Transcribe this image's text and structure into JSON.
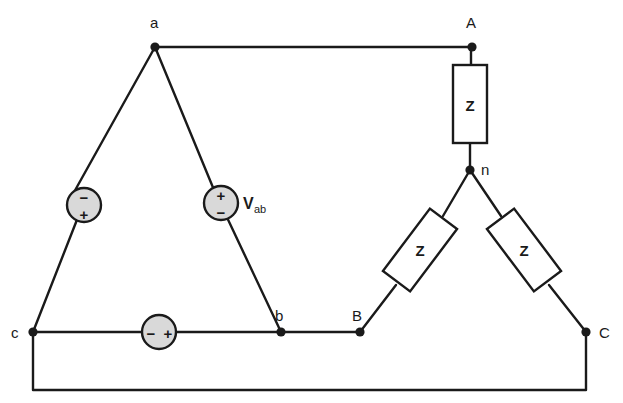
{
  "diagram": {
    "type": "circuit-schematic",
    "nodes": [
      {
        "id": "a",
        "label": "a",
        "x": 155,
        "y": 47,
        "label_x": 150,
        "label_y": 28
      },
      {
        "id": "b",
        "label": "b",
        "x": 281,
        "y": 332,
        "label_x": 275,
        "label_y": 320
      },
      {
        "id": "c",
        "label": "c",
        "x": 33,
        "y": 332,
        "label_x": 12,
        "label_y": 338
      },
      {
        "id": "A",
        "label": "A",
        "x": 472,
        "y": 47,
        "label_x": 466,
        "label_y": 28
      },
      {
        "id": "B",
        "label": "B",
        "x": 360,
        "y": 332,
        "label_x": 352,
        "label_y": 320
      },
      {
        "id": "C",
        "label": "C",
        "x": 586,
        "y": 332,
        "label_x": 599,
        "label_y": 338
      },
      {
        "id": "n",
        "label": "n",
        "x": 470,
        "y": 170,
        "label_x": 481,
        "label_y": 174
      }
    ],
    "sources": [
      {
        "id": "source-ca",
        "name": "source-ca",
        "cx": 84,
        "cy": 205,
        "r": 17,
        "orientation": "vertical",
        "top_sign": "−",
        "bottom_sign": "+",
        "label": ""
      },
      {
        "id": "source-ab",
        "name": "source-ab",
        "cx": 221,
        "cy": 203,
        "r": 17,
        "orientation": "vertical",
        "top_sign": "+",
        "bottom_sign": "−",
        "label": "V",
        "label_sub": "ab",
        "label_x": 243,
        "label_y": 209
      },
      {
        "id": "source-bc",
        "name": "source-bc",
        "cx": 159,
        "cy": 332,
        "r": 17,
        "orientation": "horizontal",
        "left_sign": "−",
        "right_sign": "+",
        "label": ""
      }
    ],
    "impedances": [
      {
        "id": "z-an",
        "name": "impedance-a-n",
        "label": "Z",
        "cx": 470,
        "cy": 104,
        "w": 34,
        "h": 78,
        "rotation": 0
      },
      {
        "id": "z-bn",
        "name": "impedance-b-n",
        "label": "Z",
        "cx": 420,
        "cy": 250,
        "w": 34,
        "h": 78,
        "rotation": 37
      },
      {
        "id": "z-cn",
        "name": "impedance-c-n",
        "label": "Z",
        "cx": 524,
        "cy": 250,
        "w": 34,
        "h": 78,
        "rotation": -37
      }
    ],
    "labels": {
      "v_ab": "V",
      "v_ab_subscript": "ab"
    },
    "colors": {
      "wire": "#1a1a1a",
      "source_fill": "#d9d9d9",
      "box_fill": "#ffffff",
      "background": "#ffffff"
    }
  }
}
